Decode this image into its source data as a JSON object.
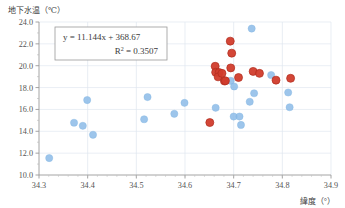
{
  "chart_data": {
    "type": "scatter",
    "title": "",
    "xlabel": "緯度（°）",
    "ylabel": "地下水温（℃）",
    "xlim": [
      34.3,
      34.9
    ],
    "ylim": [
      10.0,
      24.0
    ],
    "xticks": [
      "34.3",
      "34.4",
      "34.5",
      "34.6",
      "34.7",
      "34.8",
      "34.9"
    ],
    "xtick_values": [
      34.3,
      34.4,
      34.5,
      34.6,
      34.7,
      34.8,
      34.9
    ],
    "yticks": [
      "10.0",
      "12.0",
      "14.0",
      "16.0",
      "18.0",
      "20.0",
      "22.0",
      "24.0"
    ],
    "ytick_values": [
      10.0,
      12.0,
      14.0,
      16.0,
      18.0,
      20.0,
      22.0,
      24.0
    ],
    "grid": true,
    "legend": "none",
    "annotation_equation": "y = 11.144x + 368.67",
    "annotation_r2_prefix": "R",
    "annotation_r2_sup": "2",
    "annotation_r2_value": "= 0.3507",
    "trendline": {
      "type": "linear",
      "slope": 11.144,
      "intercept": 368.67,
      "style": "dotted",
      "color": "#7fb3e0",
      "x_start": 34.315,
      "x_end": 34.825
    },
    "series": [
      {
        "name": "blue-points",
        "color": "#8cbbe8",
        "marker": "circle",
        "points": [
          [
            34.321,
            11.55
          ],
          [
            34.372,
            14.78
          ],
          [
            34.39,
            14.5
          ],
          [
            34.399,
            16.86
          ],
          [
            34.411,
            13.68
          ],
          [
            34.516,
            15.1
          ],
          [
            34.523,
            17.13
          ],
          [
            34.578,
            15.6
          ],
          [
            34.599,
            16.6
          ],
          [
            34.663,
            16.15
          ],
          [
            34.694,
            18.62
          ],
          [
            34.701,
            18.1
          ],
          [
            34.7,
            15.35
          ],
          [
            34.712,
            15.35
          ],
          [
            34.715,
            14.58
          ],
          [
            34.737,
            23.4
          ],
          [
            34.733,
            16.7
          ],
          [
            34.742,
            17.48
          ],
          [
            34.777,
            19.15
          ],
          [
            34.812,
            17.55
          ],
          [
            34.815,
            16.2
          ]
        ]
      },
      {
        "name": "red-points",
        "color": "#d13c2c",
        "marker": "circle",
        "points": [
          [
            34.651,
            14.8
          ],
          [
            34.662,
            19.95
          ],
          [
            34.663,
            19.4
          ],
          [
            34.67,
            19.38
          ],
          [
            34.668,
            18.98
          ],
          [
            34.676,
            19.3
          ],
          [
            34.681,
            18.6
          ],
          [
            34.683,
            18.62
          ],
          [
            34.693,
            22.25
          ],
          [
            34.696,
            21.15
          ],
          [
            34.694,
            19.8
          ],
          [
            34.71,
            18.92
          ],
          [
            34.74,
            19.48
          ],
          [
            34.753,
            19.3
          ],
          [
            34.787,
            18.68
          ],
          [
            34.817,
            18.85
          ]
        ]
      }
    ]
  }
}
